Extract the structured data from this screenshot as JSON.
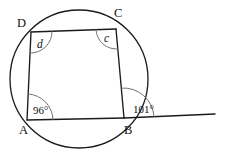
{
  "figure": {
    "type": "geometry-diagram",
    "width": 226,
    "height": 158,
    "background_color": "#ffffff",
    "stroke_color": "#1b1b1b",
    "arc_color": "#6b6b6b"
  },
  "circle": {
    "name": "circumscribed-circle",
    "center_x": 79,
    "center_y": 79,
    "radius": 69
  },
  "vertices": [
    {
      "id": "A",
      "label": "A",
      "x": 27,
      "y": 120,
      "label_x": 19,
      "label_y": 134
    },
    {
      "id": "B",
      "label": "B",
      "x": 124,
      "y": 118,
      "label_x": 124,
      "label_y": 134
    },
    {
      "id": "C",
      "label": "C",
      "x": 116,
      "y": 29,
      "label_x": 114,
      "label_y": 17
    },
    {
      "id": "D",
      "label": "D",
      "x": 31,
      "y": 32,
      "label_x": 17,
      "label_y": 27
    }
  ],
  "segments": [
    {
      "name": "side-AB",
      "from": "A",
      "to": "B"
    },
    {
      "name": "side-BC",
      "from": "B",
      "to": "C"
    },
    {
      "name": "side-CD",
      "from": "C",
      "to": "D"
    },
    {
      "name": "side-DA",
      "from": "D",
      "to": "A"
    }
  ],
  "extension_line": {
    "name": "line-AB-extended-beyond-B",
    "from_x": 124,
    "from_y": 118,
    "to_x": 215,
    "to_y": 114
  },
  "angles": [
    {
      "id": "angle-A",
      "at_vertex": "A",
      "label": "96°",
      "value": 96,
      "unit": "degrees",
      "is_known": true,
      "label_x": 33,
      "label_y": 114,
      "arc_radius": 26
    },
    {
      "id": "angle-B-exterior",
      "at_vertex": "B",
      "label": "101°",
      "value": 101,
      "unit": "degrees",
      "is_known": true,
      "label_x": 133,
      "label_y": 113,
      "arc_radius": 30
    },
    {
      "id": "angle-C",
      "at_vertex": "C",
      "label": "c",
      "value": null,
      "unit": "degrees",
      "is_known": false,
      "label_x": 104,
      "label_y": 42,
      "arc_radius": 20
    },
    {
      "id": "angle-D",
      "at_vertex": "D",
      "label": "d",
      "value": null,
      "unit": "degrees",
      "is_known": false,
      "label_x": 37,
      "label_y": 48,
      "arc_radius": 21
    }
  ]
}
